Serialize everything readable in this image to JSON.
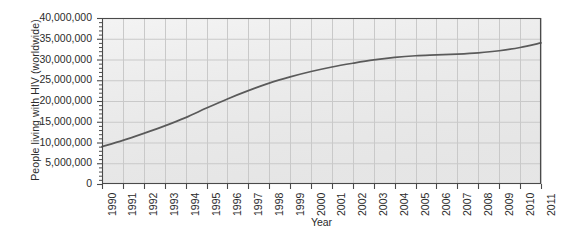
{
  "chart_data": {
    "type": "line",
    "title": "",
    "xlabel": "Year",
    "ylabel": "People living with HIV (worldwide)",
    "xlim": [
      1990,
      2011
    ],
    "ylim": [
      0,
      40000000
    ],
    "grid": true,
    "legend": "none",
    "line_color": "#5a5a5a",
    "plot_background": "#eaeaea",
    "gridline_color": "#c9c9c9",
    "frame_color": "#4a4a4a",
    "y_major_step": 5000000,
    "y_minor_step": 1000000,
    "x_tick_labels": [
      "1990",
      "1991",
      "1992",
      "1993",
      "1994",
      "1995",
      "1996",
      "1997",
      "1998",
      "1999",
      "2000",
      "2001",
      "2002",
      "2003",
      "2004",
      "2005",
      "2006",
      "2007",
      "2008",
      "2009",
      "2010",
      "2011"
    ],
    "y_tick_labels": [
      "0",
      "5,000,000",
      "10,000,000",
      "15,000,000",
      "20,000,000",
      "25,000,000",
      "30,000,000",
      "35,000,000",
      "40,000,000"
    ],
    "y_tick_values": [
      0,
      5000000,
      10000000,
      15000000,
      20000000,
      25000000,
      30000000,
      35000000,
      40000000
    ],
    "x": [
      1990,
      1991,
      1992,
      1993,
      1994,
      1995,
      1996,
      1997,
      1998,
      1999,
      2000,
      2001,
      2002,
      2003,
      2004,
      2005,
      2006,
      2007,
      2008,
      2009,
      2010,
      2011
    ],
    "values": [
      9000000,
      10500000,
      12200000,
      14000000,
      16000000,
      18300000,
      20500000,
      22500000,
      24300000,
      25800000,
      27100000,
      28200000,
      29100000,
      29900000,
      30500000,
      30900000,
      31100000,
      31300000,
      31600000,
      32100000,
      32900000,
      34000000
    ],
    "series": [
      {
        "name": "People living with HIV (worldwide)",
        "values": [
          9000000,
          10500000,
          12200000,
          14000000,
          16000000,
          18300000,
          20500000,
          22500000,
          24300000,
          25800000,
          27100000,
          28200000,
          29100000,
          29900000,
          30500000,
          30900000,
          31100000,
          31300000,
          31600000,
          32100000,
          32900000,
          34000000
        ]
      }
    ]
  }
}
